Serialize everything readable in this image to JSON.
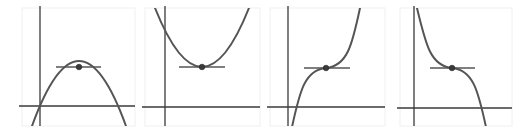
{
  "figure": {
    "colors": {
      "axis": "#3a3a3a",
      "curve": "#555555",
      "point": "#3a3a3a",
      "frame": "#f0f0f0"
    },
    "panels": [
      {
        "id": "panel-1",
        "kind": "local-maximum",
        "shape": "downward parabola",
        "frame": [
          22,
          8,
          113,
          118
        ],
        "origin": [
          40,
          106
        ],
        "point": [
          79,
          67
        ],
        "tangent": [
          56,
          101
        ],
        "curve": "M 32 126 Q 79 -4 126 126"
      },
      {
        "id": "panel-2",
        "kind": "local-minimum",
        "shape": "upward parabola",
        "frame": [
          145,
          8,
          115,
          118
        ],
        "origin": [
          165,
          107
        ],
        "point": [
          202,
          67
        ],
        "tangent": [
          179,
          225
        ],
        "curve": "M 155 8 Q 202 126 249 8"
      },
      {
        "id": "panel-3",
        "kind": "inflection-increasing",
        "shape": "increasing cubic with horizontal tangent",
        "frame": [
          270,
          8,
          115,
          118
        ],
        "origin": [
          288,
          107
        ],
        "point": [
          326,
          68
        ],
        "tangent": [
          304,
          350
        ],
        "curve": "M 292 127 C 300 90, 305 70, 326 68 C 347 66, 352 46, 360 8"
      },
      {
        "id": "panel-4",
        "kind": "inflection-decreasing",
        "shape": "decreasing cubic with horizontal tangent",
        "frame": [
          400,
          8,
          112,
          118
        ],
        "origin": [
          414,
          108
        ],
        "point": [
          452,
          68
        ],
        "tangent": [
          430,
          475
        ],
        "curve": "M 417 8 C 426 46, 431 66, 452 68 C 473 70, 478 90, 486 127"
      }
    ]
  }
}
